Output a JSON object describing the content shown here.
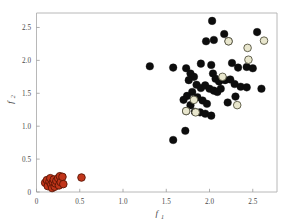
{
  "chart_data": {
    "type": "scatter",
    "title": "",
    "xlabel": "f1",
    "ylabel": "f2",
    "xlabel_base": "f",
    "xlabel_sub": "1",
    "ylabel_base": "f",
    "ylabel_sub": "2",
    "xlim": [
      0,
      2.78
    ],
    "ylim": [
      0,
      2.72
    ],
    "xticks": [
      0,
      0.5,
      1.0,
      1.5,
      2.0,
      2.5
    ],
    "xtick_labels": [
      "0",
      "0.5",
      "1.0",
      "1.5",
      "2.0",
      "2.5"
    ],
    "yticks": [
      0,
      0.5,
      1.0,
      1.5,
      2.0,
      2.5
    ],
    "ytick_labels": [
      "0",
      "0.5",
      "1.0",
      "1.5",
      "2.0",
      "2.5"
    ],
    "grid": false,
    "legend": "none",
    "marker_size": 7.6,
    "series": [
      {
        "name": "red-cluster",
        "color": "#c1351a",
        "edge_color": "#5a1505",
        "points": [
          [
            0.1,
            0.14
          ],
          [
            0.12,
            0.18
          ],
          [
            0.13,
            0.09
          ],
          [
            0.15,
            0.16
          ],
          [
            0.16,
            0.21
          ],
          [
            0.17,
            0.11
          ],
          [
            0.18,
            0.06
          ],
          [
            0.19,
            0.15
          ],
          [
            0.2,
            0.19
          ],
          [
            0.21,
            0.08
          ],
          [
            0.22,
            0.13
          ],
          [
            0.23,
            0.17
          ],
          [
            0.25,
            0.21
          ],
          [
            0.26,
            0.1
          ],
          [
            0.27,
            0.24
          ],
          [
            0.28,
            0.15
          ],
          [
            0.3,
            0.23
          ],
          [
            0.31,
            0.12
          ],
          [
            0.52,
            0.22
          ]
        ]
      },
      {
        "name": "black-cluster",
        "color": "#0d0d0d",
        "edge_color": "#0d0d0d",
        "points": [
          [
            2.03,
            2.6
          ],
          [
            2.05,
            2.31
          ],
          [
            2.17,
            2.4
          ],
          [
            2.55,
            2.43
          ],
          [
            2.22,
            2.29
          ],
          [
            1.96,
            2.29
          ],
          [
            1.31,
            1.91
          ],
          [
            1.58,
            1.89
          ],
          [
            1.73,
            1.88
          ],
          [
            1.9,
            1.95
          ],
          [
            2.02,
            1.93
          ],
          [
            2.26,
            1.96
          ],
          [
            2.33,
            1.89
          ],
          [
            2.43,
            1.9
          ],
          [
            2.5,
            1.88
          ],
          [
            1.78,
            1.8
          ],
          [
            1.82,
            1.75
          ],
          [
            1.76,
            1.7
          ],
          [
            2.04,
            1.8
          ],
          [
            2.07,
            1.72
          ],
          [
            2.11,
            1.68
          ],
          [
            2.18,
            1.7
          ],
          [
            2.24,
            1.71
          ],
          [
            2.29,
            1.64
          ],
          [
            2.36,
            1.6
          ],
          [
            2.43,
            1.59
          ],
          [
            2.6,
            1.57
          ],
          [
            1.85,
            1.63
          ],
          [
            1.9,
            1.58
          ],
          [
            1.95,
            1.62
          ],
          [
            2.0,
            1.57
          ],
          [
            2.05,
            1.54
          ],
          [
            2.09,
            1.52
          ],
          [
            2.13,
            1.57
          ],
          [
            1.8,
            1.52
          ],
          [
            1.74,
            1.46
          ],
          [
            1.7,
            1.4
          ],
          [
            1.86,
            1.44
          ],
          [
            1.92,
            1.39
          ],
          [
            1.97,
            1.34
          ],
          [
            1.78,
            1.32
          ],
          [
            1.83,
            1.22
          ],
          [
            1.89,
            1.21
          ],
          [
            1.95,
            1.19
          ],
          [
            2.02,
            1.16
          ],
          [
            1.73,
            1.23
          ],
          [
            1.72,
            0.93
          ],
          [
            1.58,
            0.79
          ],
          [
            2.21,
            1.36
          ],
          [
            2.3,
            1.45
          ]
        ]
      },
      {
        "name": "cream-cluster",
        "color": "#e8e6cd",
        "edge_color": "#55543f",
        "points": [
          [
            2.22,
            2.29
          ],
          [
            2.44,
            2.19
          ],
          [
            2.63,
            2.3
          ],
          [
            2.45,
            2.01
          ],
          [
            2.15,
            1.75
          ],
          [
            2.32,
            1.32
          ],
          [
            1.82,
            1.4
          ],
          [
            1.73,
            1.23
          ],
          [
            1.84,
            1.21
          ]
        ]
      }
    ]
  },
  "axes": {
    "frame_color": "#b0b0b0",
    "background": "#ffffff"
  }
}
